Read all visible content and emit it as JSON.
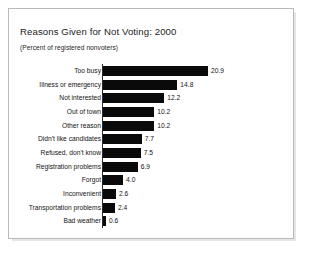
{
  "figure": {
    "title": "Reasons Given for Not Voting: 2000",
    "subtitle": "(Percent of registered nonvoters)"
  },
  "chart_data": {
    "type": "bar",
    "orientation": "horizontal",
    "title": "Reasons Given for Not Voting: 2000",
    "subtitle": "(Percent of registered nonvoters)",
    "xlabel": "",
    "ylabel": "",
    "xlim": [
      0,
      20.9
    ],
    "grid": false,
    "legend": null,
    "value_labels": true,
    "value_label_format": "one-decimal",
    "bar_color": "#0a0a0a",
    "categories": [
      "Too busy",
      "Illness or emergency",
      "Not interested",
      "Out of town",
      "Other reason",
      "Didn't like candidates",
      "Refused, don't know",
      "Registration problems",
      "Forgot",
      "Inconvenient",
      "Transportation problems",
      "Bad weather"
    ],
    "values": [
      20.9,
      14.8,
      12.2,
      10.2,
      10.2,
      7.7,
      7.5,
      6.9,
      4.0,
      2.6,
      2.4,
      0.6
    ],
    "value_labels_text": [
      "20.9",
      "14.8",
      "12.2",
      "10.2",
      "10.2",
      "7.7",
      "7.5",
      "6.9",
      "4.0",
      "2.6",
      "2.4",
      "0.6"
    ]
  }
}
